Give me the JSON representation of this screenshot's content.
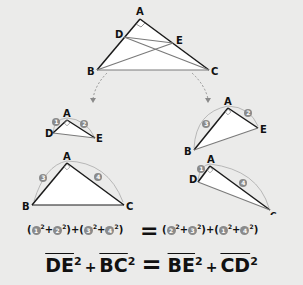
{
  "colors": {
    "background": "#ebebea",
    "triangle_fill": "#ffffff",
    "edge_dark": "#1a1a1a",
    "edge_gray": "#7a7a7a",
    "number_badge": "#8a8a8a",
    "arrow": "#8a8a8a"
  },
  "main_triangle": {
    "labels": {
      "A": "A",
      "B": "B",
      "C": "C",
      "D": "D",
      "E": "E"
    },
    "right_angle_at": "A",
    "segments": [
      "BE",
      "CD",
      "DE"
    ]
  },
  "sub_triangles": [
    {
      "id": "ADE",
      "labels": {
        "a": "A",
        "d": "D",
        "e": "E"
      },
      "legs": [
        "1",
        "2"
      ]
    },
    {
      "id": "ABC",
      "labels": {
        "a": "A",
        "b": "B",
        "c": "C"
      },
      "legs": [
        "3",
        "4"
      ]
    },
    {
      "id": "ABE",
      "labels": {
        "a": "A",
        "b": "B",
        "e": "E"
      },
      "legs": [
        "3",
        "2"
      ]
    },
    {
      "id": "ADC",
      "labels": {
        "a": "A",
        "d": "D",
        "c": "C"
      },
      "legs": [
        "1",
        "4"
      ]
    }
  ],
  "equation_numeric": {
    "left": [
      [
        "1",
        "2"
      ],
      [
        "3",
        "4"
      ]
    ],
    "equals": "=",
    "right": [
      [
        "2",
        "3"
      ],
      [
        "1",
        "4"
      ]
    ],
    "exponent": "2",
    "plus": "+",
    "open": "(",
    "close": ")"
  },
  "equation_segments": {
    "terms": [
      "DE",
      "BC",
      "BE",
      "CD"
    ],
    "exponent": "2",
    "plus": "+",
    "equals": "="
  }
}
